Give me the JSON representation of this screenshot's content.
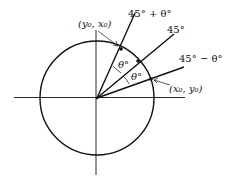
{
  "diagram": {
    "type": "unit-circle-rotation",
    "labels": {
      "ray_upper": "45° + θ°",
      "ray_middle": "45°",
      "ray_lower": "45° − θ°",
      "angle_upper": "θ°",
      "angle_lower": "θ°",
      "point_upper": "(y₀, x₀)",
      "point_lower": "(x₀, y₀)"
    },
    "colors": {
      "stroke": "#111111",
      "background": "#ffffff"
    }
  }
}
